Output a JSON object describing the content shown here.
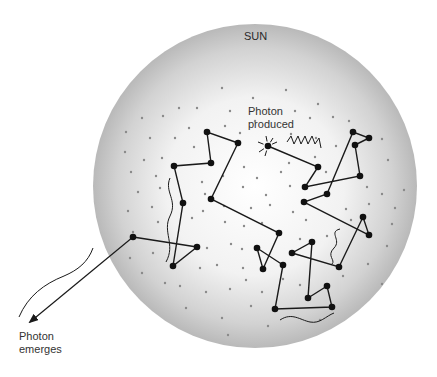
{
  "labels": {
    "sun": "SUN",
    "produced_line1": "Photon",
    "produced_line2": "produced",
    "emerges_line1": "Photon",
    "emerges_line2": "emerges"
  },
  "colors": {
    "background": "#ffffff",
    "sun_center": "#ffffff",
    "sun_edge": "#b9b9b9",
    "path": "#1a1a1a",
    "node": "#111111",
    "particle_dot": "#8a8a8a",
    "highlight_segment": "#3b3bd6"
  },
  "sun": {
    "cx": 255,
    "cy": 186,
    "r": 162
  },
  "photon_path": [
    [
      268,
      146
    ],
    [
      318,
      167
    ],
    [
      305,
      187
    ],
    [
      360,
      176
    ],
    [
      355,
      145
    ],
    [
      369,
      138
    ],
    [
      353,
      132
    ],
    [
      327,
      194
    ],
    [
      304,
      202
    ],
    [
      369,
      235
    ],
    [
      363,
      217
    ],
    [
      339,
      267
    ],
    [
      292,
      253
    ],
    [
      312,
      242
    ],
    [
      308,
      298
    ],
    [
      327,
      286
    ],
    [
      332,
      307
    ],
    [
      275,
      309
    ],
    [
      283,
      265
    ],
    [
      257,
      248
    ],
    [
      263,
      269
    ],
    [
      279,
      233
    ],
    [
      211,
      199
    ],
    [
      238,
      143
    ],
    [
      207,
      132
    ],
    [
      211,
      163
    ],
    [
      174,
      166
    ],
    [
      183,
      203
    ],
    [
      173,
      266
    ],
    [
      197,
      247
    ],
    [
      133,
      237
    ]
  ],
  "exit_arrow": {
    "from": [
      133,
      237
    ],
    "to": [
      30,
      322
    ]
  },
  "particles": [
    [
      222,
      88
    ],
    [
      253,
      98
    ],
    [
      286,
      90
    ],
    [
      179,
      108
    ],
    [
      197,
      108
    ],
    [
      230,
      111
    ],
    [
      255,
      121
    ],
    [
      295,
      111
    ],
    [
      318,
      104
    ],
    [
      333,
      117
    ],
    [
      163,
      116
    ],
    [
      142,
      118
    ],
    [
      189,
      128
    ],
    [
      225,
      126
    ],
    [
      310,
      118
    ],
    [
      349,
      121
    ],
    [
      126,
      132
    ],
    [
      150,
      138
    ],
    [
      175,
      138
    ],
    [
      194,
      147
    ],
    [
      240,
      133
    ],
    [
      291,
      134
    ],
    [
      316,
      138
    ],
    [
      336,
      146
    ],
    [
      382,
      139
    ],
    [
      125,
      152
    ],
    [
      144,
      160
    ],
    [
      162,
      158
    ],
    [
      244,
      167
    ],
    [
      289,
      163
    ],
    [
      315,
      157
    ],
    [
      388,
      160
    ],
    [
      131,
      172
    ],
    [
      156,
      176
    ],
    [
      202,
      182
    ],
    [
      223,
      176
    ],
    [
      257,
      178
    ],
    [
      281,
      172
    ],
    [
      326,
      172
    ],
    [
      367,
      187
    ],
    [
      138,
      192
    ],
    [
      160,
      188
    ],
    [
      205,
      194
    ],
    [
      243,
      187
    ],
    [
      266,
      195
    ],
    [
      290,
      186
    ],
    [
      382,
      194
    ],
    [
      404,
      190
    ],
    [
      128,
      211
    ],
    [
      152,
      207
    ],
    [
      203,
      211
    ],
    [
      224,
      206
    ],
    [
      251,
      208
    ],
    [
      270,
      205
    ],
    [
      293,
      212
    ],
    [
      346,
      209
    ],
    [
      369,
      204
    ],
    [
      395,
      208
    ],
    [
      133,
      232
    ],
    [
      158,
      222
    ],
    [
      192,
      218
    ],
    [
      225,
      222
    ],
    [
      244,
      226
    ],
    [
      262,
      223
    ],
    [
      306,
      220
    ],
    [
      351,
      220
    ],
    [
      392,
      224
    ],
    [
      130,
      258
    ],
    [
      153,
      253
    ],
    [
      207,
      248
    ],
    [
      231,
      244
    ],
    [
      242,
      249
    ],
    [
      300,
      239
    ],
    [
      327,
      236
    ],
    [
      387,
      246
    ],
    [
      142,
      273
    ],
    [
      165,
      283
    ],
    [
      200,
      268
    ],
    [
      217,
      265
    ],
    [
      243,
      268
    ],
    [
      246,
      280
    ],
    [
      283,
      279
    ],
    [
      343,
      276
    ],
    [
      368,
      264
    ],
    [
      180,
      286
    ],
    [
      206,
      292
    ],
    [
      230,
      289
    ],
    [
      262,
      292
    ],
    [
      300,
      285
    ],
    [
      382,
      284
    ],
    [
      186,
      308
    ],
    [
      222,
      318
    ],
    [
      251,
      306
    ],
    [
      320,
      320
    ],
    [
      268,
      326
    ],
    [
      228,
      335
    ]
  ],
  "squiggles": {
    "produced_wave": "M 287 142 l 4 -6 l 3 8 l 4 -8 l 3 8 l 4 -8 l 3 8 l 4 -8 l 3 8 l 4 -6 l 2 10",
    "left_wave": "M 170 178 C 164 192, 178 200, 170 216 C 162 232, 176 244, 166 262",
    "right_wave": "M 340 229 C 328 232, 342 240, 334 248 C 326 256, 336 260, 332 264",
    "bottom_wave": "M 280 320 C 292 312, 300 320, 310 322 C 320 324, 326 316, 334 313",
    "exit_wave": "M 93 248 C 88 262, 78 270, 64 276 C 44 284, 28 296, 19 317"
  },
  "sparkle": {
    "cx": 268,
    "cy": 146,
    "rays": [
      [
        -10,
        -4
      ],
      [
        -9,
        6
      ],
      [
        -2,
        -10
      ],
      [
        5,
        -8
      ],
      [
        -3,
        10
      ],
      [
        9,
        -4
      ]
    ]
  }
}
